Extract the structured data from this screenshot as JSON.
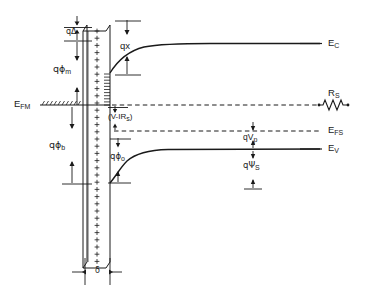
{
  "figure": {
    "colors": {
      "line": "#1a1a1a",
      "background": "#ffffff"
    }
  },
  "labels": {
    "q_delta": {
      "text": "qΔ",
      "base": "q",
      "sub": ""
    },
    "q_phi_m": {
      "base": "qϕ",
      "sub": "m"
    },
    "q_chi": {
      "text": "qx"
    },
    "q_phi_b": {
      "base": "qϕ",
      "sub": "b"
    },
    "q_phi_o": {
      "base": "qϕ",
      "sub": "o"
    },
    "e_fm": {
      "base": "E",
      "sub": "FM"
    },
    "e_c": {
      "base": "E",
      "sub": "C"
    },
    "e_fs": {
      "base": "E",
      "sub": "FS"
    },
    "e_v": {
      "base": "E",
      "sub": "V"
    },
    "r_s": {
      "base": "R",
      "sub": "S"
    },
    "v_minus_irs": {
      "text": "(V-IR",
      "sub": "s",
      "tail": ")"
    },
    "q_v_p": {
      "base": "qV",
      "sub": "p"
    },
    "q_psi_s": {
      "base": "qΨ",
      "sub": "S"
    },
    "delta": {
      "text": "δ"
    }
  },
  "icons": {
    "resistor": "resistor-zigzag-icon",
    "interfacial_charge": "plus-charge-column-icon",
    "arrow_up": "arrow-up-icon",
    "arrow_down": "arrow-down-icon"
  },
  "chart_data": {
    "type": "line",
    "xlabel": "",
    "ylabel": "Electron energy",
    "xlim": [
      0,
      369
    ],
    "ylim": [
      293,
      0
    ],
    "grid": false,
    "legend": null,
    "annotations": [
      {
        "name": "q-delta",
        "label": "qΔ",
        "meaning": "image-force barrier lowering across interfacial layer",
        "x": 72,
        "y": 30
      },
      {
        "name": "q-phi-m",
        "label": "qϕm",
        "meaning": "metal work function",
        "x": 65,
        "y": 68
      },
      {
        "name": "q-chi",
        "label": "qx",
        "meaning": "semiconductor electron affinity",
        "x": 128,
        "y": 44
      },
      {
        "name": "q-phi-b",
        "label": "qϕb",
        "meaning": "barrier height",
        "x": 60,
        "y": 145
      },
      {
        "name": "q-phi-o",
        "label": "qϕo",
        "meaning": "zero-bias barrier",
        "x": 120,
        "y": 155
      },
      {
        "name": "e-fm",
        "label": "EFM",
        "meaning": "metal Fermi level",
        "x": 16,
        "y": 105
      },
      {
        "name": "e-c",
        "label": "EC",
        "meaning": "conduction band edge",
        "x": 330,
        "y": 47
      },
      {
        "name": "r-s",
        "label": "RS",
        "meaning": "series resistance",
        "x": 330,
        "y": 94
      },
      {
        "name": "e-fs",
        "label": "EFS",
        "meaning": "semiconductor Fermi level",
        "x": 330,
        "y": 134
      },
      {
        "name": "e-v",
        "label": "EV",
        "meaning": "valence band edge",
        "x": 330,
        "y": 152
      },
      {
        "name": "v-minus-irs",
        "label": "(V-IRs)",
        "meaning": "applied voltage less series drop",
        "x": 112,
        "y": 118
      },
      {
        "name": "q-v-p",
        "label": "qVp",
        "meaning": "Fermi level to valence band separation in bulk",
        "x": 253,
        "y": 144
      },
      {
        "name": "q-psi-s",
        "label": "qΨS",
        "meaning": "surface band bending",
        "x": 253,
        "y": 170
      },
      {
        "name": "delta",
        "label": "δ",
        "meaning": "interfacial layer thickness",
        "x": 103,
        "y": 272
      }
    ],
    "series": [
      {
        "name": "vacuum-level-metal",
        "role": "metal vacuum level (top of qϕm)",
        "points": [
          [
            72,
            28
          ],
          [
            108,
            28
          ]
        ]
      },
      {
        "name": "conduction-band",
        "role": "E_C conduction band edge with interface band bending",
        "points": [
          [
            112,
            72
          ],
          [
            118,
            64
          ],
          [
            126,
            57
          ],
          [
            136,
            52
          ],
          [
            150,
            48
          ],
          [
            168,
            46
          ],
          [
            190,
            45
          ],
          [
            230,
            45
          ],
          [
            320,
            45
          ]
        ]
      },
      {
        "name": "valence-band",
        "role": "E_V valence band edge with interface band bending",
        "points": [
          [
            112,
            182
          ],
          [
            118,
            175
          ],
          [
            124,
            168
          ],
          [
            131,
            162
          ],
          [
            140,
            157
          ],
          [
            152,
            153
          ],
          [
            170,
            151
          ],
          [
            200,
            150
          ],
          [
            250,
            150
          ],
          [
            320,
            150
          ]
        ]
      },
      {
        "name": "fermi-level-metal",
        "role": "E_FM metal Fermi level (hatched horizontal line)",
        "points": [
          [
            42,
            105
          ],
          [
            112,
            105
          ]
        ]
      },
      {
        "name": "fermi-level-semiconductor",
        "role": "E_FS semiconductor Fermi level (dashed)",
        "points": [
          [
            116,
            131
          ],
          [
            320,
            131
          ]
        ]
      },
      {
        "name": "quasi-fermi-metal-extension",
        "role": "metal Fermi level dashed extension at bias (V-IRs)",
        "points": [
          [
            116,
            105
          ],
          [
            320,
            105
          ]
        ]
      }
    ],
    "shapes": [
      {
        "name": "interfacial-layer",
        "role": "thin interfacial insulator slab filled with + surface charges",
        "x_left": 88,
        "x_right": 110,
        "y_top": 25,
        "y_bottom": 268,
        "charge_symbol": "+"
      }
    ]
  }
}
